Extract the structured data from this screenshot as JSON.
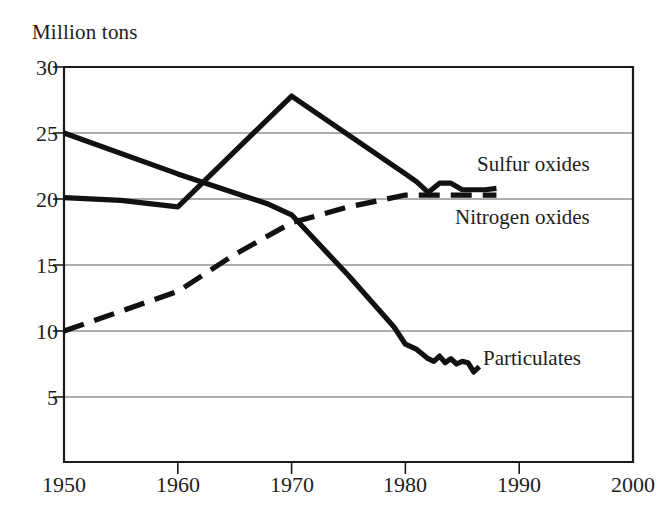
{
  "chart_data": {
    "type": "line",
    "title": "",
    "ylabel": "Million tons",
    "xlabel": "",
    "xlim": [
      1950,
      2000
    ],
    "ylim": [
      2.5,
      30
    ],
    "grid": "horizontal",
    "legend_position": "inline-right",
    "yticks": [
      30,
      25,
      20,
      15,
      10,
      5
    ],
    "xticks": [
      1950,
      1960,
      1970,
      1980,
      1990,
      2000
    ],
    "series": [
      {
        "name": "Sulfur oxides",
        "style": "solid",
        "color": "#111111",
        "label_x": 1992,
        "label_y": 23.0,
        "points": [
          [
            1950,
            20.1
          ],
          [
            1955,
            19.9
          ],
          [
            1960,
            19.4
          ],
          [
            1970,
            27.8
          ],
          [
            1980,
            21.9
          ],
          [
            1981,
            21.3
          ],
          [
            1982,
            20.5
          ],
          [
            1983,
            21.2
          ],
          [
            1984,
            21.2
          ],
          [
            1985,
            20.7
          ],
          [
            1987,
            20.7
          ],
          [
            1988,
            20.8
          ]
        ]
      },
      {
        "name": "Particulates",
        "style": "solid",
        "color": "#111111",
        "label_x": 1992,
        "label_y": 8.0,
        "points": [
          [
            1950,
            25.0
          ],
          [
            1960,
            21.9
          ],
          [
            1968,
            19.6
          ],
          [
            1970,
            18.8
          ],
          [
            1975,
            14.2
          ],
          [
            1979,
            10.3
          ],
          [
            1980,
            9.0
          ],
          [
            1981,
            8.6
          ],
          [
            1982,
            7.9
          ],
          [
            1982.5,
            7.7
          ],
          [
            1983,
            8.1
          ],
          [
            1983.5,
            7.6
          ],
          [
            1984,
            7.9
          ],
          [
            1984.5,
            7.5
          ],
          [
            1985,
            7.7
          ],
          [
            1985.5,
            7.6
          ],
          [
            1986,
            6.9
          ],
          [
            1986.5,
            7.3
          ]
        ]
      },
      {
        "name": "Nitrogen oxides",
        "style": "dashed",
        "color": "#111111",
        "label_x": 1992,
        "label_y": 18.5,
        "points": [
          [
            1950,
            10.0
          ],
          [
            1960,
            13.0
          ],
          [
            1965,
            15.8
          ],
          [
            1970,
            18.2
          ],
          [
            1975,
            19.4
          ],
          [
            1980,
            20.3
          ],
          [
            1984,
            20.3
          ],
          [
            1988,
            20.3
          ]
        ]
      }
    ]
  },
  "labels": {
    "y_axis_title": "Million tons",
    "yticks": [
      "30",
      "25",
      "20",
      "15",
      "10",
      "5"
    ],
    "xticks": [
      "1950",
      "1960",
      "1970",
      "1980",
      "1990",
      "2000"
    ],
    "sulfur": "Sulfur oxides",
    "nitrogen": "Nitrogen oxides",
    "particulates": "Particulates"
  },
  "colors": {
    "line": "#111111",
    "frame": "#1a1a1a",
    "grid": "#5a5a5a",
    "text": "#1d1d1d",
    "background": "#ffffff"
  }
}
